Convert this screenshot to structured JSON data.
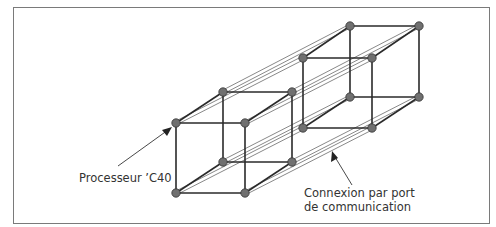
{
  "diagram": {
    "labels": {
      "processor": "Processeur ’C40",
      "connection_line1": "Connexion par port",
      "connection_line2": "de communication"
    },
    "colors": {
      "edge": "#2a2a2a",
      "thin_link": "#555555",
      "node_fill": "#707070",
      "node_stroke": "#333333",
      "frame": "#7a7a7a"
    },
    "cubes": [
      {
        "name": "left-cube",
        "front": [
          [
            176,
            123
          ],
          [
            245,
            123
          ],
          [
            245,
            193
          ],
          [
            176,
            193
          ]
        ],
        "back": [
          [
            223,
            92
          ],
          [
            292,
            92
          ],
          [
            292,
            162
          ],
          [
            223,
            162
          ]
        ]
      },
      {
        "name": "right-cube",
        "front": [
          [
            303,
            58
          ],
          [
            372,
            58
          ],
          [
            372,
            128
          ],
          [
            303,
            128
          ]
        ],
        "back": [
          [
            350,
            26
          ],
          [
            419,
            26
          ],
          [
            419,
            97
          ],
          [
            350,
            97
          ]
        ]
      }
    ]
  }
}
